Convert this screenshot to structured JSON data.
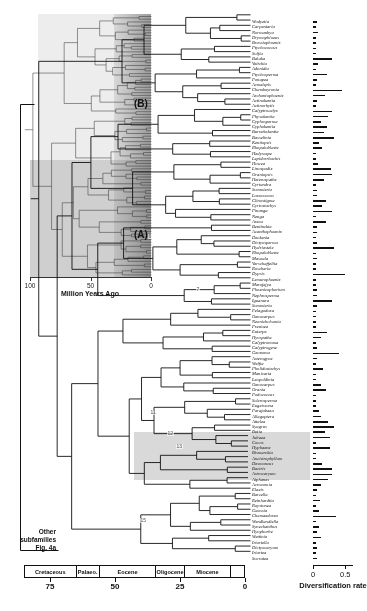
{
  "inset": {
    "label_a": "(A)",
    "label_b": "(B)",
    "axis_title": "Million Years Ago",
    "ticks": [
      "100",
      "50",
      "0"
    ],
    "tick_values": [
      100,
      50,
      0
    ]
  },
  "other_subfamilies": {
    "line1": "Other",
    "line2": "subfamilies",
    "line3": "Fig. 4a"
  },
  "timescale": {
    "epochs": [
      {
        "label": "Cretaceous",
        "start": 85,
        "end": 65
      },
      {
        "label": "Palaeo.",
        "start": 65,
        "end": 56
      },
      {
        "label": "Eocene",
        "start": 56,
        "end": 34
      },
      {
        "label": "Oligocene",
        "start": 34,
        "end": 23
      },
      {
        "label": "Miocene",
        "start": 23,
        "end": 5
      },
      {
        "label": "",
        "start": 5,
        "end": 0
      }
    ],
    "ticks": [
      "75",
      "50",
      "25",
      "0"
    ],
    "tick_values": [
      75,
      50,
      25,
      0
    ],
    "axis_max": 85,
    "axis_min": 0
  },
  "rate_axis": {
    "title": "Diversification rate",
    "ticks": [
      "0",
      "0.5"
    ],
    "tick_values": [
      0,
      0.5
    ],
    "max": 0.62
  },
  "node_labels": [
    {
      "text": "6",
      "x": 148,
      "y": 234
    },
    {
      "text": "7",
      "x": 196,
      "y": 287
    },
    {
      "text": "11",
      "x": 150,
      "y": 410
    },
    {
      "text": "12",
      "x": 167,
      "y": 431
    },
    {
      "text": "13",
      "x": 176,
      "y": 444
    },
    {
      "text": "15",
      "x": 140,
      "y": 518
    }
  ],
  "highlight_band": {
    "top": 432,
    "height": 48
  },
  "chart_data": {
    "type": "bar",
    "title": "Diversification rate",
    "xlabel": "Diversification rate",
    "ylabel": "Genus",
    "xlim": [
      0,
      0.62
    ],
    "orientation": "horizontal",
    "grid": false,
    "legend": false,
    "categories": [
      "Wodyetia",
      "Carpentaria",
      "Normanbya",
      "Drymophloeus",
      "Brassiophoenix",
      "Ptychococcus",
      "Solfia",
      "Balaka",
      "Veitchia",
      "Adonidia",
      "Ptychosperma",
      "Ponapea",
      "Acmelepis",
      "Chambeyronia",
      "Archontophoenix",
      "Actinokentia",
      "Actinorhytis",
      "Calyptrocalyx",
      "Physokentia",
      "Cyphosperma",
      "Cyphokentia",
      "Burretiokentia",
      "Basselinia",
      "Kentiopsis",
      "Rhopaloblaste",
      "Hedyscepe",
      "Lepidorrhachis",
      "Howea",
      "Linospadix",
      "Oraniopsis",
      "Heterospathe",
      "Cyrtandra",
      "Sommieria",
      "Loxococcus",
      "Clinostigma",
      "Cyrtostachys",
      "Pinanga",
      "Nenga",
      "Areca",
      "Bentinckia",
      "Acanthophoenix",
      "Deckenia",
      "Dictyosperma",
      "Hydriastele",
      "Rhopaloblaste",
      "Masoala",
      "Verschaffeltia",
      "Roscheria",
      "Dypsis",
      "Lemurophoenix",
      "Marojejya",
      "Phoenicophorium",
      "Nephrosperma",
      "Iguanura",
      "Sommieria",
      "Pelagodoxa",
      "Oenocarpus",
      "Neonicholsonia",
      "Prestoea",
      "Euterpe",
      "Hyospathe",
      "Calyptronoma",
      "Calyptrogyne",
      "Geonoma",
      "Asterogyne",
      "Welfia",
      "Pholidostachys",
      "Manicaria",
      "Leopoldinia",
      "Oenocarpus",
      "Orania",
      "Podococcus",
      "Sclerosperma",
      "Eugeissona",
      "Parajubaea",
      "Allagoptera",
      "Attalea",
      "Syagrus",
      "Butia",
      "Jubaea",
      "Cocos",
      "Hyphaene",
      "Bismarckia",
      "Ancistrophyllum",
      "Desmoncus",
      "Bactris",
      "Astrocaryum",
      "Aiphanes",
      "Acrocomia",
      "Elaeis",
      "Barcella",
      "Reinhardtia",
      "Roystonea",
      "Gaussia",
      "Chamaedorea",
      "Wendlandiella",
      "Synechanthus",
      "Hyophorbe",
      "Wettinia",
      "Iriartella",
      "Dictyocaryum",
      "Iriartea",
      "Socratea"
    ],
    "values": [
      0.06,
      0.05,
      0.07,
      0.05,
      0.05,
      0.05,
      0.04,
      0.3,
      0.07,
      0.05,
      0.22,
      0.06,
      0.05,
      0.45,
      0.18,
      0.06,
      0.05,
      0.3,
      0.24,
      0.12,
      0.22,
      0.17,
      0.33,
      0.1,
      0.14,
      0.04,
      0.04,
      0.08,
      0.28,
      0.3,
      0.17,
      0.05,
      0.06,
      0.06,
      0.2,
      0.14,
      0.29,
      0.05,
      0.2,
      0.06,
      0.06,
      0.05,
      0.06,
      0.33,
      0.05,
      0.06,
      0.05,
      0.05,
      0.5,
      0.05,
      0.05,
      0.06,
      0.06,
      0.3,
      0.06,
      0.05,
      0.05,
      0.05,
      0.05,
      0.21,
      0.12,
      0.05,
      0.06,
      0.4,
      0.06,
      0.05,
      0.16,
      0.05,
      0.05,
      0.12,
      0.2,
      0.05,
      0.05,
      0.05,
      0.09,
      0.12,
      0.24,
      0.33,
      0.18,
      0.26,
      0.05,
      0.27,
      0.05,
      0.05,
      0.14,
      0.3,
      0.3,
      0.24,
      0.12,
      0.06,
      0.05,
      0.11,
      0.05,
      0.09,
      0.36,
      0.05,
      0.09,
      0.06,
      0.13,
      0.05,
      0.06,
      0.05,
      0.06
    ]
  },
  "taxa": [
    "Wodyetia",
    "Carpentaria",
    "Normanbya",
    "Drymophloeus",
    "Brassiophoenix",
    "Ptychococcus",
    "Solfia",
    "Balaka",
    "Veitchia",
    "Adonidia",
    "Ptychosperma",
    "Ponapea",
    "Acmelepis",
    "Chambeyronia",
    "Archontophoenix",
    "Actinokentia",
    "Actinorhytis",
    "Calyptrocalyx",
    "Physokentia",
    "Cyphosperma",
    "Cyphokentia",
    "Burretiokentia",
    "Basselinia",
    "Kentiopsis",
    "Rhopaloblaste",
    "Hedyscepe",
    "Lepidorrhachis",
    "Howea",
    "Linospadix",
    "Oraniopsis",
    "Heterospathe",
    "Cyrtandra",
    "Sommieria",
    "Loxococcus",
    "Clinostigma",
    "Cyrtostachys",
    "Pinanga",
    "Nenga",
    "Areca",
    "Bentinckia",
    "Acanthophoenix",
    "Deckenia",
    "Dictyosperma",
    "Hydriastele",
    "Rhopaloblaste",
    "Masoala",
    "Verschaffeltia",
    "Roscheria",
    "Dypsis",
    "Lemurophoenix",
    "Marojejya",
    "Phoenicophorium",
    "Nephrosperma",
    "Iguanura",
    "Sommieria",
    "Pelagodoxa",
    "Oenocarpus",
    "Neonicholsonia",
    "Prestoea",
    "Euterpe",
    "Hyospathe",
    "Calyptronoma",
    "Calyptrogyne",
    "Geonoma",
    "Asterogyne",
    "Welfia",
    "Pholidostachys",
    "Manicaria",
    "Leopoldinia",
    "Oenocarpus",
    "Orania",
    "Podococcus",
    "Sclerosperma",
    "Eugeissona",
    "Parajubaea",
    "Allagoptera",
    "Attalea",
    "Syagrus",
    "Butia",
    "Jubaea",
    "Cocos",
    "Hyphaene",
    "Bismarckia",
    "Ancistrophyllum",
    "Desmoncus",
    "Bactris",
    "Astrocaryum",
    "Aiphanes",
    "Acrocomia",
    "Elaeis",
    "Barcella",
    "Reinhardtia",
    "Roystonea",
    "Gaussia",
    "Chamaedorea",
    "Wendlandiella",
    "Synechanthus",
    "Hyophorbe",
    "Wettinia",
    "Iriartella",
    "Dictyocaryum",
    "Iriartea",
    "Socratea"
  ]
}
